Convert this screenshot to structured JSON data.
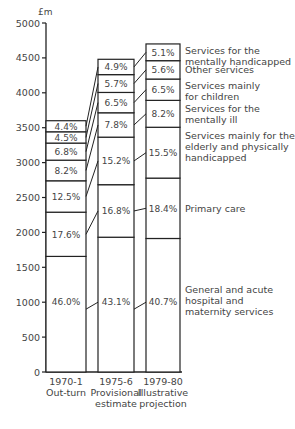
{
  "chart_data": {
    "type": "bar",
    "stacked": true,
    "title": "",
    "ylabel": "£m",
    "xlabel": "",
    "ylim": [
      0,
      5000
    ],
    "yticks": [
      0,
      500,
      1000,
      1500,
      2000,
      2500,
      3000,
      3500,
      4000,
      4500,
      5000
    ],
    "grid": false,
    "legend_position": "right (labels beside last bar)",
    "categories": [
      {
        "line1": "1970-1",
        "line2": "Out-turn",
        "line3": ""
      },
      {
        "line1": "1975-6",
        "line2": "Provisional",
        "line3": "estimate"
      },
      {
        "line1": "1979-80",
        "line2": "Illustrative",
        "line3": "projection"
      }
    ],
    "totals": [
      3600,
      4480,
      4700
    ],
    "series": [
      {
        "name": "General and acute hospital and maternity services",
        "label_lines": [
          "General and acute",
          "hospital and",
          "maternity services"
        ],
        "values_pct": [
          46.0,
          43.1,
          40.7
        ],
        "labels": [
          "46.0%",
          "43.1%",
          "40.7%"
        ]
      },
      {
        "name": "Primary care",
        "label_lines": [
          "Primary care"
        ],
        "values_pct": [
          17.6,
          16.8,
          18.4
        ],
        "labels": [
          "17.6%",
          "16.8%",
          "18.4%"
        ]
      },
      {
        "name": "Services mainly for the elderly and physically handicapped",
        "label_lines": [
          "Services mainly for the",
          "elderly and physically",
          "handicapped"
        ],
        "values_pct": [
          12.5,
          15.2,
          15.5
        ],
        "labels": [
          "12.5%",
          "15.2%",
          "15.5%"
        ]
      },
      {
        "name": "Services for the mentally ill",
        "label_lines": [
          "Services for the",
          "mentally ill"
        ],
        "values_pct": [
          8.2,
          7.8,
          8.2
        ],
        "labels": [
          "8.2%",
          "7.8%",
          "8.2%"
        ]
      },
      {
        "name": "Services mainly for children",
        "label_lines": [
          "Services mainly",
          "for children"
        ],
        "values_pct": [
          6.8,
          6.5,
          6.5
        ],
        "labels": [
          "6.8%",
          "6.5%",
          "6.5%"
        ]
      },
      {
        "name": "Other services",
        "label_lines": [
          "Other services"
        ],
        "values_pct": [
          4.5,
          5.7,
          5.6
        ],
        "labels": [
          "4.5%",
          "5.7%",
          "5.6%"
        ]
      },
      {
        "name": "Services for the mentally handicapped",
        "label_lines": [
          "Services for the",
          "mentally handicapped"
        ],
        "values_pct": [
          4.4,
          4.9,
          5.1
        ],
        "labels": [
          "4.4%",
          "4.9%",
          "5.1%"
        ]
      }
    ]
  }
}
